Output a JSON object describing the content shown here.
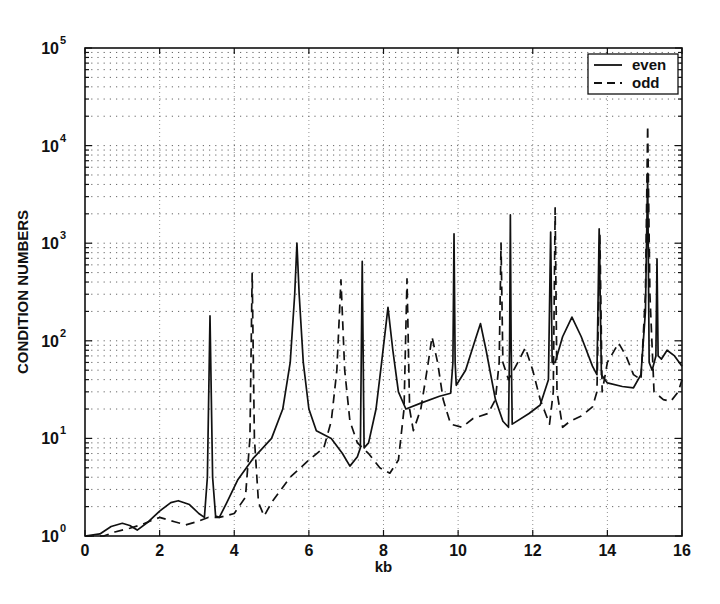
{
  "chart_data": {
    "type": "line",
    "title": "",
    "xlabel": "kb",
    "ylabel": "CONDITION  NUMBERS",
    "xlim": [
      0,
      16
    ],
    "ylim": [
      1,
      100000
    ],
    "yscale": "log",
    "grid": true,
    "x_ticks": [
      0,
      2,
      4,
      6,
      8,
      10,
      12,
      14,
      16
    ],
    "x_tick_labels": [
      "0",
      "2",
      "4",
      "6",
      "8",
      "10",
      "12",
      "14",
      "16"
    ],
    "y_ticks": [
      1,
      10,
      100,
      1000,
      10000,
      100000
    ],
    "y_tick_labels": [
      {
        "base": "10",
        "exp": "0"
      },
      {
        "base": "10",
        "exp": "1"
      },
      {
        "base": "10",
        "exp": "2"
      },
      {
        "base": "10",
        "exp": "3"
      },
      {
        "base": "10",
        "exp": "4"
      },
      {
        "base": "10",
        "exp": "5"
      }
    ],
    "legend": {
      "position": "upper right",
      "entries": [
        "even",
        "odd"
      ]
    },
    "series": [
      {
        "name": "even",
        "style": "solid",
        "points": [
          [
            0.0,
            1.0
          ],
          [
            0.4,
            1.05
          ],
          [
            0.7,
            1.25
          ],
          [
            1.0,
            1.35
          ],
          [
            1.2,
            1.28
          ],
          [
            1.4,
            1.15
          ],
          [
            1.7,
            1.4
          ],
          [
            2.0,
            1.8
          ],
          [
            2.3,
            2.2
          ],
          [
            2.5,
            2.3
          ],
          [
            2.8,
            2.1
          ],
          [
            3.05,
            1.7
          ],
          [
            3.2,
            1.55
          ],
          [
            3.28,
            4
          ],
          [
            3.35,
            180
          ],
          [
            3.42,
            4
          ],
          [
            3.5,
            1.6
          ],
          [
            3.6,
            1.55
          ],
          [
            3.8,
            2.2
          ],
          [
            4.1,
            3.8
          ],
          [
            4.5,
            6.2
          ],
          [
            5.0,
            10
          ],
          [
            5.3,
            20
          ],
          [
            5.5,
            60
          ],
          [
            5.62,
            300
          ],
          [
            5.68,
            1000
          ],
          [
            5.74,
            300
          ],
          [
            5.85,
            60
          ],
          [
            6.0,
            20
          ],
          [
            6.2,
            12
          ],
          [
            6.6,
            10
          ],
          [
            6.9,
            7
          ],
          [
            7.1,
            5.2
          ],
          [
            7.3,
            6.5
          ],
          [
            7.38,
            8
          ],
          [
            7.43,
            650
          ],
          [
            7.48,
            8
          ],
          [
            7.6,
            9
          ],
          [
            7.8,
            20
          ],
          [
            7.95,
            60
          ],
          [
            8.12,
            220
          ],
          [
            8.25,
            80
          ],
          [
            8.4,
            30
          ],
          [
            8.6,
            20
          ],
          [
            9.0,
            23
          ],
          [
            9.5,
            27
          ],
          [
            9.8,
            29
          ],
          [
            9.86,
            60
          ],
          [
            9.89,
            1250
          ],
          [
            9.92,
            60
          ],
          [
            9.95,
            35
          ],
          [
            10.2,
            50
          ],
          [
            10.45,
            100
          ],
          [
            10.6,
            150
          ],
          [
            10.75,
            80
          ],
          [
            11.0,
            25
          ],
          [
            11.2,
            15
          ],
          [
            11.35,
            13
          ],
          [
            11.38,
            100
          ],
          [
            11.4,
            1950
          ],
          [
            11.42,
            100
          ],
          [
            11.45,
            14
          ],
          [
            11.9,
            18
          ],
          [
            12.2,
            22
          ],
          [
            12.42,
            40
          ],
          [
            12.48,
            1300
          ],
          [
            12.52,
            60
          ],
          [
            12.6,
            60
          ],
          [
            12.8,
            110
          ],
          [
            13.05,
            175
          ],
          [
            13.3,
            110
          ],
          [
            13.6,
            55
          ],
          [
            13.72,
            45
          ],
          [
            13.78,
            1400
          ],
          [
            13.84,
            45
          ],
          [
            14.0,
            37
          ],
          [
            14.4,
            34
          ],
          [
            14.7,
            33
          ],
          [
            14.9,
            45
          ],
          [
            15.02,
            200
          ],
          [
            15.08,
            5200
          ],
          [
            15.12,
            60
          ],
          [
            15.2,
            50
          ],
          [
            15.3,
            70
          ],
          [
            15.33,
            690
          ],
          [
            15.36,
            70
          ],
          [
            15.45,
            65
          ],
          [
            15.6,
            80
          ],
          [
            15.8,
            70
          ],
          [
            16.0,
            55
          ]
        ]
      },
      {
        "name": "odd",
        "style": "dashed",
        "points": [
          [
            0.0,
            1.0
          ],
          [
            0.5,
            1.0
          ],
          [
            0.8,
            1.1
          ],
          [
            1.2,
            1.2
          ],
          [
            1.5,
            1.3
          ],
          [
            1.8,
            1.45
          ],
          [
            2.0,
            1.55
          ],
          [
            2.4,
            1.4
          ],
          [
            2.7,
            1.3
          ],
          [
            3.0,
            1.4
          ],
          [
            3.3,
            1.55
          ],
          [
            3.6,
            1.55
          ],
          [
            4.0,
            1.7
          ],
          [
            4.3,
            2.5
          ],
          [
            4.42,
            10
          ],
          [
            4.48,
            490
          ],
          [
            4.54,
            10
          ],
          [
            4.65,
            2.2
          ],
          [
            4.8,
            1.6
          ],
          [
            5.0,
            2.2
          ],
          [
            5.5,
            4
          ],
          [
            6.0,
            6
          ],
          [
            6.4,
            8
          ],
          [
            6.6,
            15
          ],
          [
            6.75,
            50
          ],
          [
            6.86,
            420
          ],
          [
            6.96,
            50
          ],
          [
            7.1,
            15
          ],
          [
            7.3,
            9
          ],
          [
            7.6,
            7
          ],
          [
            7.9,
            5
          ],
          [
            8.17,
            4.4
          ],
          [
            8.4,
            6
          ],
          [
            8.55,
            20
          ],
          [
            8.63,
            430
          ],
          [
            8.7,
            20
          ],
          [
            8.8,
            12
          ],
          [
            9.0,
            20
          ],
          [
            9.2,
            60
          ],
          [
            9.3,
            110
          ],
          [
            9.45,
            60
          ],
          [
            9.6,
            25
          ],
          [
            9.8,
            14
          ],
          [
            10.1,
            13
          ],
          [
            10.4,
            16
          ],
          [
            10.8,
            18
          ],
          [
            11.0,
            25
          ],
          [
            11.1,
            60
          ],
          [
            11.15,
            1000
          ],
          [
            11.2,
            60
          ],
          [
            11.35,
            40
          ],
          [
            11.6,
            60
          ],
          [
            11.8,
            85
          ],
          [
            12.0,
            50
          ],
          [
            12.2,
            25
          ],
          [
            12.45,
            14
          ],
          [
            12.55,
            30
          ],
          [
            12.6,
            2300
          ],
          [
            12.65,
            30
          ],
          [
            12.8,
            13
          ],
          [
            13.0,
            15
          ],
          [
            13.3,
            17
          ],
          [
            13.6,
            21
          ],
          [
            13.72,
            30
          ],
          [
            13.8,
            1200
          ],
          [
            13.86,
            30
          ],
          [
            14.0,
            60
          ],
          [
            14.3,
            95
          ],
          [
            14.5,
            70
          ],
          [
            14.7,
            45
          ],
          [
            14.9,
            40
          ],
          [
            15.02,
            300
          ],
          [
            15.08,
            16000
          ],
          [
            15.14,
            300
          ],
          [
            15.25,
            30
          ],
          [
            15.5,
            25
          ],
          [
            15.7,
            24
          ],
          [
            15.9,
            30
          ],
          [
            16.0,
            40
          ]
        ]
      }
    ]
  },
  "layout": {
    "plot": {
      "left": 85,
      "top": 48,
      "right": 682,
      "bottom": 536
    },
    "legend_box": {
      "x": 588,
      "y": 54,
      "w": 90,
      "h": 40
    }
  }
}
